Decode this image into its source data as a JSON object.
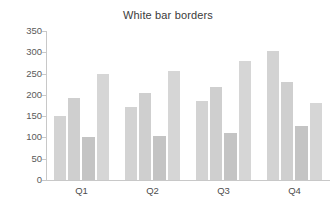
{
  "chart_data": {
    "type": "bar",
    "title": "White bar borders",
    "xlabel": "",
    "ylabel": "",
    "categories": [
      "Q1",
      "Q2",
      "Q3",
      "Q4"
    ],
    "series": [
      {
        "name": "Series 1",
        "values": [
          150,
          171,
          186,
          303
        ],
        "color": "#d3d3d3"
      },
      {
        "name": "Series 2",
        "values": [
          193,
          205,
          219,
          230
        ],
        "color": "#cfcfcf"
      },
      {
        "name": "Series 3",
        "values": [
          101,
          103,
          110,
          126
        ],
        "color": "#c4c4c4"
      },
      {
        "name": "Series 4",
        "values": [
          248,
          256,
          280,
          181
        ],
        "color": "#d6d6d6"
      }
    ],
    "ylim": [
      0,
      350
    ],
    "yticks": [
      0,
      50,
      100,
      150,
      200,
      250,
      300,
      350
    ],
    "ytick_labels": [
      "0",
      "50",
      "100",
      "150",
      "200",
      "250",
      "300",
      "350"
    ],
    "grid": false,
    "legend": "none",
    "bar_border_color": "#ffffff",
    "axis_color": "#c8c8c8",
    "background": "#ffffff"
  }
}
